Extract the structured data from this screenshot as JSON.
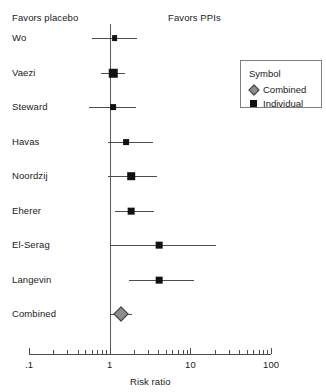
{
  "header": {
    "left_label": "Favors placebo",
    "right_label": "Favors PPIs"
  },
  "legend": {
    "title": "Symbol",
    "items": [
      {
        "label": "Combined",
        "symbol": "diamond",
        "color": "#8c8c8c"
      },
      {
        "label": "Individual",
        "symbol": "square",
        "color": "#111111"
      }
    ]
  },
  "chart_data": {
    "type": "forest",
    "title": "",
    "xlabel": "Risk ratio",
    "ylabel": "",
    "xscale": "log",
    "xlim": [
      0.1,
      100
    ],
    "null_value": 1,
    "grid": false,
    "legend_position": "top-right",
    "annotations": {
      "left": "Favors placebo",
      "right": "Favors PPIs"
    },
    "tick_labels": [
      ".1",
      "1",
      "10",
      "100"
    ],
    "tick_values": [
      0.1,
      1,
      10,
      100
    ],
    "categories": [
      "Wo",
      "Vaezi",
      "Steward",
      "Havas",
      "Noordzij",
      "Eherer",
      "El-Serag",
      "Langevin",
      "Combined"
    ],
    "series": [
      {
        "name": "Risk ratio",
        "points": [
          {
            "study": "Wo",
            "estimate": 1.15,
            "ci_low": 0.6,
            "ci_high": 2.2,
            "type": "individual",
            "weight": 2
          },
          {
            "study": "Vaezi",
            "estimate": 1.1,
            "ci_low": 0.79,
            "ci_high": 1.55,
            "type": "individual",
            "weight": 5
          },
          {
            "study": "Steward",
            "estimate": 1.1,
            "ci_low": 0.56,
            "ci_high": 2.1,
            "type": "individual",
            "weight": 2
          },
          {
            "study": "Havas",
            "estimate": 1.6,
            "ci_low": 0.95,
            "ci_high": 3.4,
            "type": "individual",
            "weight": 2
          },
          {
            "study": "Noordzij",
            "estimate": 1.85,
            "ci_low": 0.95,
            "ci_high": 3.9,
            "type": "individual",
            "weight": 4
          },
          {
            "study": "Eherer",
            "estimate": 1.85,
            "ci_low": 1.15,
            "ci_high": 3.5,
            "type": "individual",
            "weight": 3
          },
          {
            "study": "El-Serag",
            "estimate": 4.1,
            "ci_low": 1.02,
            "ci_high": 21.0,
            "type": "individual",
            "weight": 3
          },
          {
            "study": "Langevin",
            "estimate": 4.1,
            "ci_low": 1.75,
            "ci_high": 11.0,
            "type": "individual",
            "weight": 3
          },
          {
            "study": "Combined",
            "estimate": 1.4,
            "ci_low": 1.05,
            "ci_high": 1.9,
            "type": "combined",
            "weight": 0
          }
        ]
      }
    ]
  }
}
